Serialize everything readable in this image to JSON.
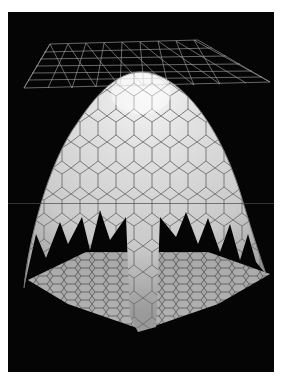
{
  "figure": {
    "background": "#050505",
    "page_background": "#ffffff",
    "mesh_color": "#c8c8c8",
    "dome_fill": "#cfcfcf",
    "dome_highlight": "#f4f4f4",
    "cell_stroke": "#6a6a6a",
    "floor_fill": "#a9a9a9",
    "floor_stroke": "#3a3a3a",
    "elements": [
      {
        "name": "wireframe-mesh",
        "description": "flat triangulated wireframe plane above apex"
      },
      {
        "name": "hexagonal-dome",
        "description": "paraboloid dome tessellated with elongated hexagonal cells, jagged lower edge"
      },
      {
        "name": "hexagonal-floor",
        "description": "flat hexagon-tiled plane at base, viewed in perspective"
      }
    ]
  }
}
